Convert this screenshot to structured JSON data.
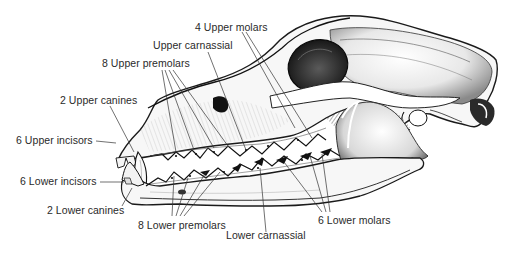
{
  "diagram": {
    "colors": {
      "ink": "#1a1a1a",
      "label": "#2a2a2a",
      "background": "#ffffff"
    },
    "labels": {
      "upper_molars": "4 Upper molars",
      "upper_carnassial": "Upper carnassial",
      "upper_premolars": "8 Upper premolars",
      "upper_canines": "2 Upper canines",
      "upper_incisors": "6 Upper incisors",
      "lower_incisors": "6 Lower incisors",
      "lower_canines": "2 Lower canines",
      "lower_premolars": "8 Lower premolars",
      "lower_carnassial": "Lower carnassial",
      "lower_molars": "6 Lower molars"
    }
  }
}
